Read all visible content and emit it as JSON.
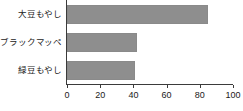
{
  "chart_data": {
    "type": "bar",
    "orientation": "horizontal",
    "title": "",
    "xlabel": "",
    "ylabel": "",
    "categories": [
      "大豆もやし",
      "ブラックマッペ",
      "緑豆もやし"
    ],
    "values": [
      85,
      42,
      41
    ],
    "xlim": [
      0,
      100
    ],
    "xticks": [
      0,
      20,
      40,
      60,
      80,
      100
    ],
    "xtick_labels": [
      "0",
      "20",
      "40",
      "60",
      "80",
      "100"
    ],
    "grid": false,
    "legend": null,
    "bar_color": "#8e8e8e",
    "axis_color": "#3b3b3b"
  },
  "axis": {
    "ticks": [
      {
        "label": "0",
        "value": 0
      },
      {
        "label": "20",
        "value": 20
      },
      {
        "label": "40",
        "value": 40
      },
      {
        "label": "60",
        "value": 60
      },
      {
        "label": "80",
        "value": 80
      },
      {
        "label": "100",
        "value": 100
      }
    ]
  },
  "series": [
    {
      "label": "大豆もやし",
      "value": 85
    },
    {
      "label": "ブラックマッペ",
      "value": 42
    },
    {
      "label": "緑豆もやし",
      "value": 41
    }
  ]
}
